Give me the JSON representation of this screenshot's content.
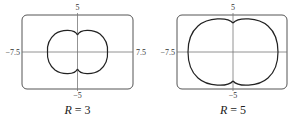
{
  "panels": [
    {
      "caption_var": "R",
      "caption_eq": " = 3",
      "ticks": {
        "top": "5",
        "bottom": "−5",
        "left": "−7.5",
        "right": "7.5"
      },
      "window": {
        "xmin": -7.5,
        "xmax": 7.5,
        "ymin": -5,
        "ymax": 5
      }
    },
    {
      "caption_var": "R",
      "caption_eq": " = 5",
      "ticks": {
        "top": "5",
        "bottom": "−5",
        "left": "−7.5",
        "right": ""
      },
      "window": {
        "xmin": -7.5,
        "xmax": 7.5,
        "ymin": -5,
        "ymax": 5
      }
    }
  ],
  "colors": {
    "frame": "#555555",
    "axis": "#777777",
    "curve": "#222222"
  }
}
